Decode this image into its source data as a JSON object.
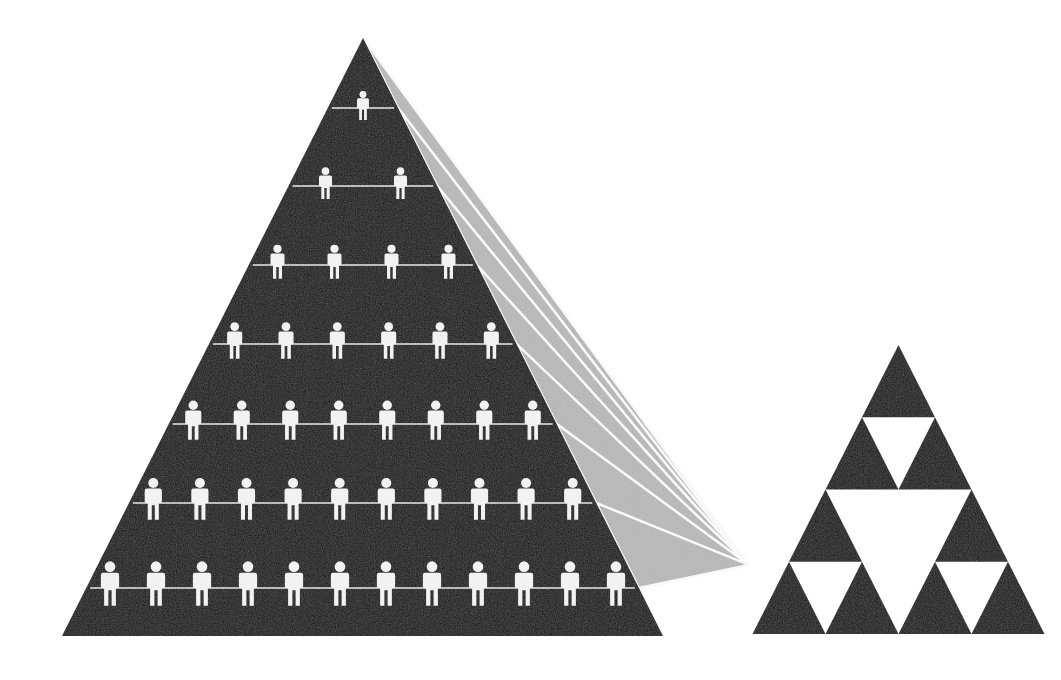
{
  "canvas": {
    "width": 1061,
    "height": 680,
    "background_color": "#ffffff"
  },
  "palette": {
    "pyramid_fill": "#111111",
    "ray_fill": "#b9b9b9",
    "figure_fill": "#f2f2f2",
    "rule_line": "#e8e8e8",
    "background": "#ffffff"
  },
  "chart_data": {
    "type": "diagram",
    "title": "",
    "subtitle": "",
    "xlabel": "",
    "ylabel": "",
    "left_pyramid": {
      "name": "population-pyramid",
      "shape": "triangle",
      "fill": "#111111",
      "apex": {
        "x": 363,
        "y": 38
      },
      "base_left": {
        "x": 62,
        "y": 636
      },
      "base_right": {
        "x": 663,
        "y": 636
      },
      "tier_count": 7,
      "total_figures": 43,
      "tiers": [
        {
          "index": 1,
          "figures": 1,
          "baseline_y": 108,
          "half_width": 36
        },
        {
          "index": 2,
          "figures": 2,
          "baseline_y": 186,
          "half_width": 75
        },
        {
          "index": 3,
          "figures": 4,
          "baseline_y": 265,
          "half_width": 114
        },
        {
          "index": 4,
          "figures": 6,
          "baseline_y": 344,
          "half_width": 154
        },
        {
          "index": 5,
          "figures": 8,
          "baseline_y": 424,
          "half_width": 194
        },
        {
          "index": 6,
          "figures": 10,
          "baseline_y": 503,
          "half_width": 233
        },
        {
          "index": 7,
          "figures": 12,
          "baseline_y": 588,
          "half_width": 276
        }
      ]
    },
    "rays": {
      "name": "convergence-rays",
      "fill": "#b9b9b9",
      "count": 7,
      "converge_point": {
        "x": 749,
        "y": 565
      },
      "note": "Each ray is a wedge from a pyramid tier's right-hand edge to the shared convergence point; thin white gaps separate adjacent wedges."
    },
    "right_triangle": {
      "name": "sierpinski-triangle",
      "shape": "sierpinski-triangle",
      "fill": "#111111",
      "apex": {
        "x": 862,
        "y": 345
      },
      "base_left": {
        "x": 715,
        "y": 634
      },
      "base_right": {
        "x": 1007,
        "y": 634
      },
      "rows": 4,
      "upward_triangles": 10,
      "downward_gaps": 6
    }
  },
  "accessibility": {
    "alt_text": "Black triangular population pyramid of 43 human icons arranged in tiers of 1, 2, 4, 6, 8, 10 and 12; grey beams radiate from the pyramid's right flank and converge on a smaller black Sierpinski triangle."
  }
}
